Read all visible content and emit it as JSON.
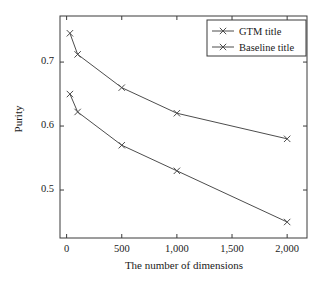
{
  "chart_data": {
    "type": "line",
    "title": "",
    "xlabel": "The number of dimensions",
    "ylabel": "Purity",
    "xlim": [
      -60,
      2180
    ],
    "ylim": [
      0.425,
      0.772
    ],
    "grid": false,
    "legend_position": "top-right",
    "x_ticks": [
      {
        "value": 0,
        "label": "0"
      },
      {
        "value": 500,
        "label": "500"
      },
      {
        "value": 1000,
        "label": "1,000"
      },
      {
        "value": 1500,
        "label": "1,500"
      },
      {
        "value": 2000,
        "label": "2,000"
      }
    ],
    "y_ticks": [
      {
        "value": 0.5,
        "label": "0.5"
      },
      {
        "value": 0.6,
        "label": "0.6"
      },
      {
        "value": 0.7,
        "label": "0.7"
      }
    ],
    "x": [
      30,
      100,
      500,
      1000,
      2000
    ],
    "series": [
      {
        "name": "GTM title",
        "marker": "x",
        "color": "#4d4d4d",
        "values": [
          0.745,
          0.712,
          0.66,
          0.62,
          0.58
        ]
      },
      {
        "name": "Baseline title",
        "marker": "x",
        "color": "#4d4d4d",
        "values": [
          0.65,
          0.622,
          0.57,
          0.53,
          0.45
        ]
      }
    ],
    "legend": [
      "GTM title",
      "Baseline title"
    ],
    "colors": {
      "axis": "#3a3a3a",
      "line": "#4d4d4d",
      "background": "#ffffff",
      "text": "#1a1a1a"
    }
  }
}
